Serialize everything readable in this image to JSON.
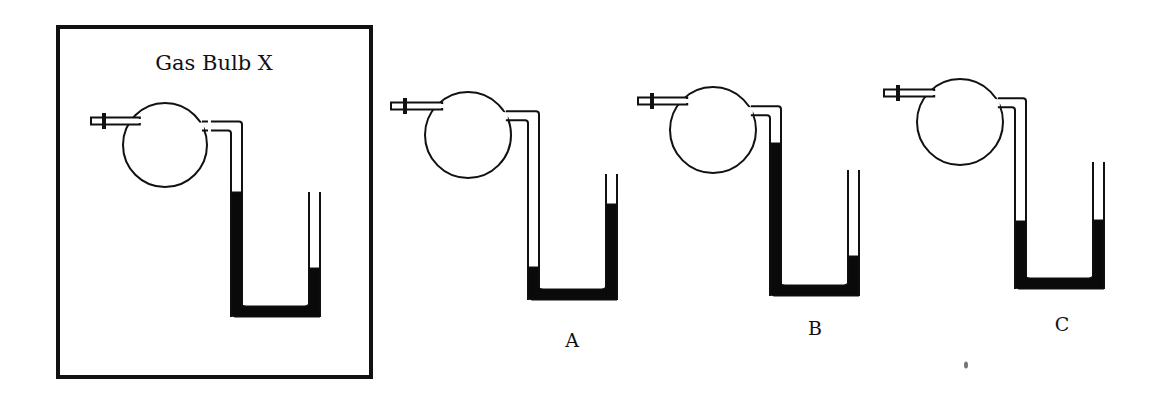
{
  "figure": {
    "reference_box": {
      "title": "Gas Bulb X",
      "x": 58,
      "y": 27,
      "w": 313,
      "h": 350
    },
    "apparatus": [
      {
        "id": "X",
        "label": "",
        "bulb": {
          "cx": 165,
          "cy": 145,
          "r": 42
        },
        "inlet": {
          "x1": 91,
          "x2": 140,
          "y": 121,
          "stopcock_x": 104
        },
        "connector_gap": true,
        "manometer": {
          "left_x": 231,
          "right_x": 309,
          "tube_w": 11,
          "top_y": 140,
          "right_top_y": 192,
          "bottom_y": 317,
          "left_level_y": 192,
          "right_level_y": 268
        }
      },
      {
        "id": "A",
        "label": "A",
        "label_pos": {
          "x": 572,
          "y": 347
        },
        "bulb": {
          "cx": 468,
          "cy": 135,
          "r": 43
        },
        "inlet": {
          "x1": 391,
          "x2": 440,
          "y": 106,
          "stopcock_x": 405
        },
        "connector_gap": false,
        "manometer": {
          "left_x": 528,
          "right_x": 606,
          "tube_w": 11,
          "top_y": 121,
          "right_top_y": 174,
          "bottom_y": 300,
          "left_level_y": 267,
          "right_level_y": 204
        }
      },
      {
        "id": "B",
        "label": "B",
        "label_pos": {
          "x": 815,
          "y": 335
        },
        "bulb": {
          "cx": 713,
          "cy": 130,
          "r": 43
        },
        "inlet": {
          "x1": 638,
          "x2": 683,
          "y": 101,
          "stopcock_x": 652
        },
        "connector_gap": false,
        "manometer": {
          "left_x": 770,
          "right_x": 848,
          "tube_w": 11,
          "top_y": 116,
          "right_top_y": 170,
          "bottom_y": 296,
          "left_level_y": 143,
          "right_level_y": 256
        }
      },
      {
        "id": "C",
        "label": "C",
        "label_pos": {
          "x": 1062,
          "y": 331
        },
        "bulb": {
          "cx": 960,
          "cy": 122,
          "r": 43
        },
        "inlet": {
          "x1": 884,
          "x2": 930,
          "y": 93,
          "stopcock_x": 898
        },
        "connector_gap": false,
        "manometer": {
          "left_x": 1015,
          "right_x": 1093,
          "tube_w": 11,
          "top_y": 108,
          "right_top_y": 162,
          "bottom_y": 289,
          "left_level_y": 221,
          "right_level_y": 220
        }
      }
    ],
    "colors": {
      "ink": "#111111",
      "mercury": "#0a0a0a",
      "background": "#ffffff"
    }
  }
}
